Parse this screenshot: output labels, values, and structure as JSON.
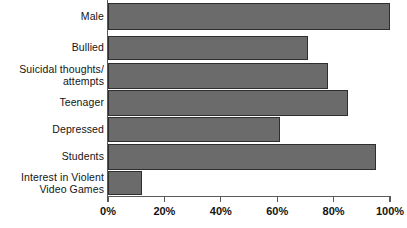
{
  "chart_data": {
    "type": "bar",
    "orientation": "horizontal",
    "title": "",
    "subtitle": "",
    "xlabel": "",
    "ylabel": "",
    "xlim": [
      0,
      100
    ],
    "grid": false,
    "legend": null,
    "categories": [
      "Male",
      "Bullied",
      "Suicidal thoughts/ attempts",
      "Teenager",
      "Depressed",
      "Students",
      "Interest in Violent Video Games"
    ],
    "category_lines": [
      [
        "Male"
      ],
      [
        "Bullied"
      ],
      [
        "Suicidal thoughts/",
        "attempts"
      ],
      [
        "Teenager"
      ],
      [
        "Depressed"
      ],
      [
        "Students"
      ],
      [
        "Interest in Violent",
        "Video Games"
      ]
    ],
    "values": [
      100,
      71,
      78,
      85,
      61,
      95,
      12
    ],
    "tick_labels": [
      "0%",
      "20%",
      "40%",
      "60%",
      "80%",
      "100%"
    ],
    "tick_values": [
      0,
      20,
      40,
      60,
      80,
      100
    ],
    "colors": {
      "bar_fill": "#6b6b6b",
      "bar_outline": "#2e2e2e",
      "axis": "#5a5a5a",
      "text": "#141414",
      "background": "#ffffff"
    }
  },
  "bar_layout": [
    {
      "top": 3,
      "height": 27
    },
    {
      "top": 36,
      "height": 24
    },
    {
      "top": 63,
      "height": 26
    },
    {
      "top": 90,
      "height": 26
    },
    {
      "top": 117,
      "height": 25
    },
    {
      "top": 144,
      "height": 26
    },
    {
      "top": 171,
      "height": 24
    }
  ],
  "label_layout": [
    {
      "top": 11
    },
    {
      "top": 42
    },
    {
      "top": 64
    },
    {
      "top": 97
    },
    {
      "top": 124
    },
    {
      "top": 151
    },
    {
      "top": 172
    }
  ]
}
